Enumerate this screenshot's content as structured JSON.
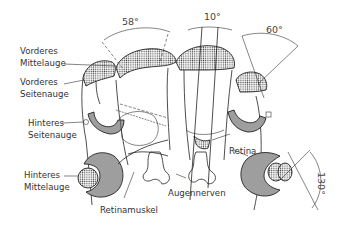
{
  "diagram": {
    "type": "anatomical illustration",
    "labels": {
      "vorderes_mittelauge": [
        "Vorderes",
        "Mittelauge"
      ],
      "vorderes_seitenauge": [
        "Vorderes",
        "Seitenauge"
      ],
      "hinteres_seitenauge": [
        "Hinteres",
        "Seitenauge"
      ],
      "hinteres_mittelauge": [
        "Hinteres",
        "Mittelauge"
      ],
      "retinamuskel": "Retinamuskel",
      "augennerven": "Augennerven",
      "retina": "Retina"
    },
    "angles": {
      "a58": "58°",
      "a10": "10°",
      "a60": "60°",
      "a130": "130°"
    },
    "colors": {
      "line": "#222222",
      "text": "#333333",
      "background": "#ffffff"
    }
  }
}
